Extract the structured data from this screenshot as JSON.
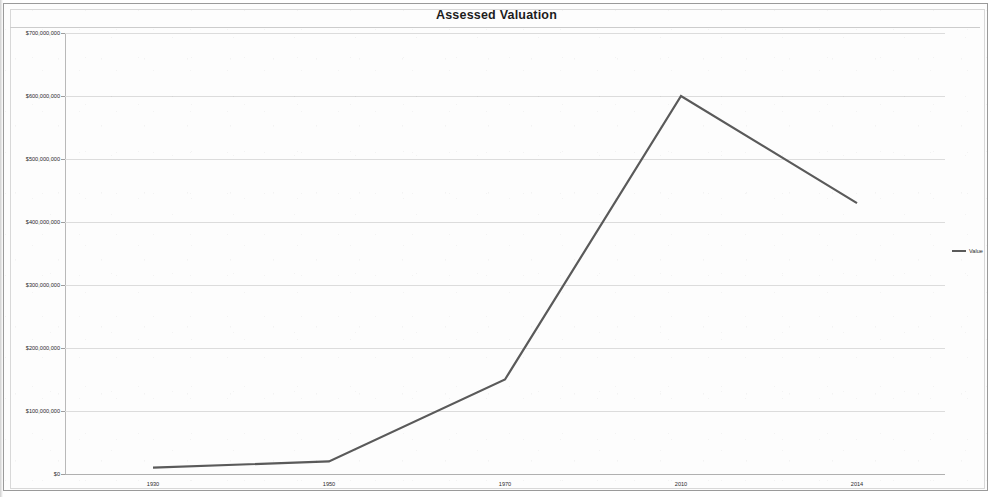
{
  "chart_data": {
    "type": "line",
    "title": "Assessed Valuation",
    "xlabel": "",
    "ylabel": "",
    "categories": [
      "1930",
      "1950",
      "1970",
      "2010",
      "2014"
    ],
    "series": [
      {
        "name": "Value",
        "values": [
          10000000,
          20000000,
          150000000,
          600000000,
          430000000
        ]
      }
    ],
    "ylim": [
      0,
      700000000
    ],
    "ytick_values": [
      0,
      100000000,
      200000000,
      300000000,
      400000000,
      500000000,
      600000000,
      700000000
    ],
    "ytick_labels": [
      "$0",
      "$100,000,000",
      "$200,000,000",
      "$300,000,000",
      "$400,000,000",
      "$500,000,000",
      "$600,000,000",
      "$700,000,000"
    ],
    "grid": true,
    "legend_position": "right",
    "line_color": "#5a5a5a",
    "gridline_color": "#dcdcdc"
  },
  "legend": {
    "entries": [
      {
        "label": "Value",
        "color": "#5a5a5a"
      }
    ]
  }
}
